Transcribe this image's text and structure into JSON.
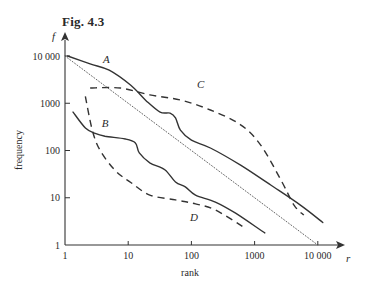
{
  "figure": {
    "title": "Fig. 4.3"
  },
  "chart_data": {
    "type": "line",
    "title": "Fig. 4.3",
    "xlabel": "rank",
    "ylabel": "frequency",
    "x_symbol": "r",
    "y_symbol": "f",
    "xscale": "log",
    "yscale": "log",
    "xlim": [
      1,
      10000
    ],
    "ylim": [
      1,
      10000
    ],
    "x_ticks": [
      1,
      10,
      100,
      1000,
      10000
    ],
    "x_tick_labels": [
      "1",
      "10",
      "100",
      "1000",
      "10 000"
    ],
    "y_ticks": [
      1,
      10,
      100,
      1000,
      10000
    ],
    "y_tick_labels": [
      "1",
      "10",
      "100",
      "1000",
      "10 000"
    ],
    "grid": false,
    "legend": "none",
    "series": [
      {
        "name": "A",
        "style": "solid",
        "x": [
          1.1,
          2.5,
          5,
          11,
          19,
          32,
          46,
          56,
          67,
          100,
          200,
          600,
          1800,
          5300,
          12000
        ],
        "y": [
          10000,
          6800,
          5000,
          2400,
          1150,
          650,
          620,
          490,
          270,
          165,
          113,
          49,
          18.6,
          7,
          3
        ],
        "label_at": [
          4.5,
          7000
        ]
      },
      {
        "name": "B",
        "style": "solid",
        "x": [
          1.34,
          2.1,
          3,
          4.3,
          9,
          13,
          15,
          22,
          38,
          56,
          80,
          116,
          240,
          500,
          1450
        ],
        "y": [
          650,
          300,
          230,
          200,
          175,
          145,
          89,
          55,
          39,
          21.5,
          17,
          11.4,
          8.1,
          4.7,
          1.8
        ],
        "label_at": [
          4.3,
          320
        ]
      },
      {
        "name": "C",
        "style": "dashed",
        "x": [
          2.5,
          7.5,
          22,
          67,
          200,
          600,
          1250,
          2600,
          4200,
          6000
        ],
        "y": [
          2100,
          2100,
          1500,
          1170,
          720,
          350,
          130,
          24,
          7,
          4.3
        ],
        "label_at": [
          140,
          2100
        ]
      },
      {
        "name": "D",
        "style": "dashed",
        "x": [
          2.1,
          2.7,
          3.6,
          6.2,
          11,
          22,
          56,
          116,
          240,
          700
        ],
        "y": [
          1400,
          270,
          100,
          38,
          21,
          11.4,
          9,
          7.4,
          5.5,
          2.3
        ],
        "label_at": [
          110,
          3.2
        ]
      },
      {
        "name": "reference",
        "style": "dotted",
        "x": [
          1,
          10000
        ],
        "y": [
          10000,
          1
        ]
      }
    ]
  }
}
